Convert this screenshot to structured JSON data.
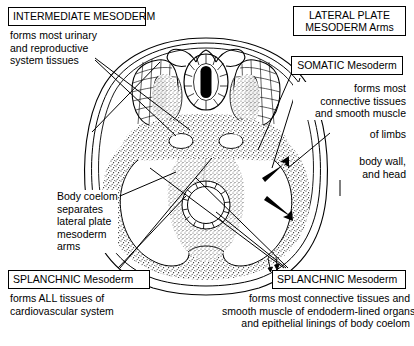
{
  "figure": {
    "title_alt": "Transverse section of embryo showing mesoderm derivatives",
    "colors": {
      "ink": "#000000",
      "paper": "#ffffff",
      "stipple": "#555555"
    }
  },
  "labels": {
    "intermediate": {
      "heading": "INTERMEDIATE MESODERM",
      "body": "forms most urinary\nand reproductive\nsystem tissues"
    },
    "lateral_plate": {
      "heading": "LATERAL PLATE\nMESODERM Arms"
    },
    "somatic": {
      "heading": "SOMATIC Mesoderm",
      "body": "forms most\nconnective tissues\nand smooth muscle",
      "limbs": "of limbs",
      "body_wall": "body wall,\nand head"
    },
    "coelom": {
      "body": "Body coelom\nseparates\nlateral plate\nmesoderm\narms"
    },
    "splanchnic_left": {
      "heading": "SPLANCHNIC Mesoderm",
      "body": "forms ALL tissues of\ncardiovascular system"
    },
    "splanchnic_right": {
      "heading": "SPLANCHNIC Mesoderm",
      "body": "forms most connective tissues and\nsmooth muscle of endoderm-lined organs\nand epithelial linings of body coelom"
    }
  },
  "anatomy": {
    "parts": [
      "neural-tube",
      "neural-crest",
      "somite-dermomyotome",
      "somite-sclerotome",
      "intermediate-mesoderm",
      "dorsal-aorta-left",
      "dorsal-aorta-right",
      "somatic-mesoderm",
      "splanchnic-mesoderm",
      "body-coelom-left",
      "body-coelom-right",
      "gut-tube",
      "ectoderm",
      "amnion"
    ]
  },
  "annotations": {
    "arrows": [
      {
        "name": "somatic-arrow-upper",
        "direction": "outward-right"
      },
      {
        "name": "somatic-arrow-lower",
        "direction": "outward-right"
      },
      {
        "name": "splanchnic-small-arrow",
        "direction": "down"
      }
    ]
  }
}
